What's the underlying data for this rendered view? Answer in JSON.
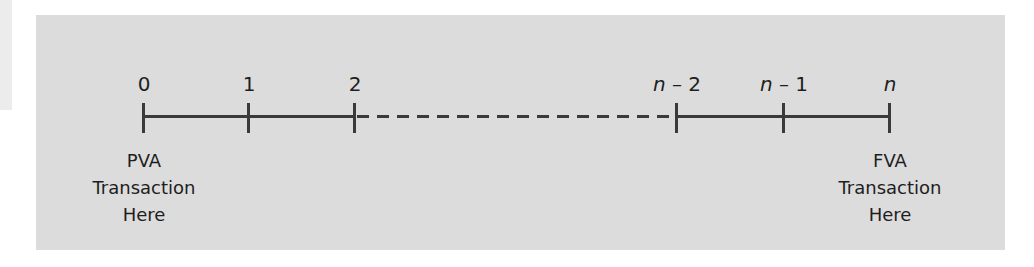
{
  "diagram": {
    "title": "",
    "type": "timeline",
    "colors": {
      "panel_background": "#dcdcdc",
      "line": "#3a3a3a",
      "text": "#1e1e1e"
    },
    "ticks": [
      {
        "id": "t0",
        "var": "",
        "text": "0",
        "x": 143
      },
      {
        "id": "t1",
        "var": "",
        "text": "1",
        "x": 248
      },
      {
        "id": "t2",
        "var": "",
        "text": "2",
        "x": 354
      },
      {
        "id": "tn2",
        "var": "n",
        "text": " – 2",
        "x": 676
      },
      {
        "id": "tn1",
        "var": "n",
        "text": " – 1",
        "x": 783
      },
      {
        "id": "tn",
        "var": "n",
        "text": "",
        "x": 889
      }
    ],
    "segments": [
      {
        "from": 143,
        "to": 354,
        "style": "solid"
      },
      {
        "from": 354,
        "to": 676,
        "style": "dashed"
      },
      {
        "from": 676,
        "to": 889,
        "style": "solid"
      }
    ],
    "annotations": {
      "left": {
        "line1": "PVA",
        "line2": "Transaction",
        "line3": "Here",
        "x": 143
      },
      "right": {
        "line1": "FVA",
        "line2": "Transaction",
        "line3": "Here",
        "x": 889
      }
    }
  }
}
